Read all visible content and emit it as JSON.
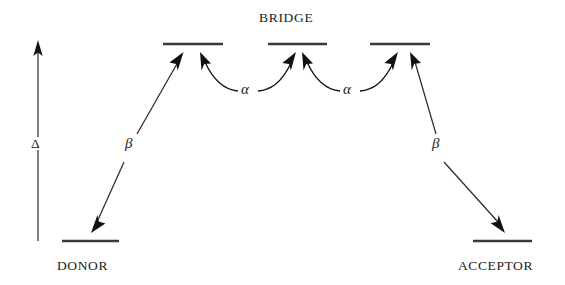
{
  "figure": {
    "type": "energy-level-diagram",
    "background_color": "#ffffff",
    "line_color": "#2b2b2b",
    "level_color": "#3a3a3a",
    "text_color": "#1c1c1c"
  },
  "labels": {
    "bridge": "BRIDGE",
    "donor": "DONOR",
    "acceptor": "ACCEPTOR",
    "delta": "Δ",
    "beta_left": "β",
    "beta_right": "β",
    "alpha_left": "α",
    "alpha_right": "α"
  },
  "levels": [
    {
      "name": "donor-level",
      "x1": 62,
      "x2": 119,
      "y": 241
    },
    {
      "name": "bridge-level-left",
      "x1": 163,
      "x2": 223,
      "y": 44
    },
    {
      "name": "bridge-level-mid",
      "x1": 268,
      "x2": 327,
      "y": 44
    },
    {
      "name": "bridge-level-right",
      "x1": 370,
      "x2": 430,
      "y": 44
    },
    {
      "name": "acceptor-level",
      "x1": 473,
      "x2": 532,
      "y": 241
    }
  ],
  "couplings": [
    {
      "name": "beta-donor-bridge",
      "symbol": "β",
      "from": "donor-level",
      "to": "bridge-level-left",
      "style": "straight-double-arrow"
    },
    {
      "name": "alpha-bridge-1-2",
      "symbol": "α",
      "from": "bridge-level-left",
      "to": "bridge-level-mid",
      "style": "curved-double-arrow"
    },
    {
      "name": "alpha-bridge-2-3",
      "symbol": "α",
      "from": "bridge-level-mid",
      "to": "bridge-level-right",
      "style": "curved-double-arrow"
    },
    {
      "name": "beta-bridge-acceptor",
      "symbol": "β",
      "from": "bridge-level-right",
      "to": "acceptor-level",
      "style": "straight-double-arrow"
    }
  ],
  "energy_axis": {
    "name": "delta-energy-axis",
    "symbol": "Δ",
    "x": 38,
    "y_top": 43,
    "y_bottom": 241,
    "direction": "up"
  }
}
